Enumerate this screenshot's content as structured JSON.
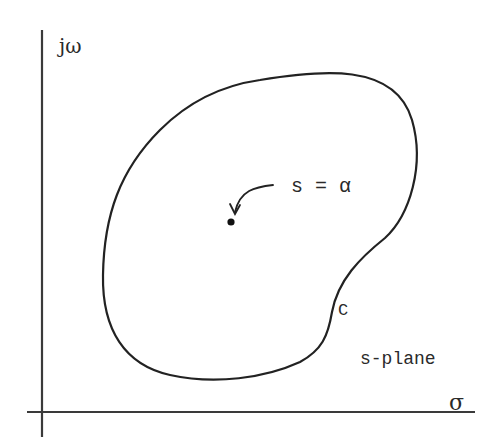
{
  "diagram": {
    "axes": {
      "vertical_label": "jω",
      "horizontal_label": "σ"
    },
    "contour_label": "C",
    "point_label": "s = α",
    "plane_label": "s-plane",
    "colors": {
      "ink": "#222222",
      "background": "#ffffff"
    }
  }
}
